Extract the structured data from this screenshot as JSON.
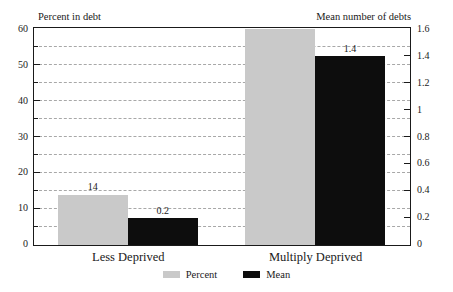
{
  "chart_data": {
    "type": "bar",
    "title": "",
    "xlabel": "",
    "ylabel": "Percent in debt",
    "y2label": "Mean number of debts",
    "categories": [
      "Less Deprived",
      "Multiply Deprived"
    ],
    "series": [
      {
        "name": "Percent",
        "axis": "left",
        "color": "#c9c9c9",
        "values": [
          14,
          60
        ],
        "labels": [
          "14",
          "60"
        ]
      },
      {
        "name": "Mean",
        "axis": "right",
        "color": "#0d0d0d",
        "values": [
          0.2,
          1.4
        ],
        "labels": [
          "0.2",
          "1.4"
        ]
      }
    ],
    "ylim": [
      0,
      60
    ],
    "y2lim": [
      0,
      1.6
    ],
    "yticks": [
      0,
      10,
      20,
      30,
      40,
      50,
      60
    ],
    "ytick_labels": [
      "0",
      "10",
      "20",
      "30",
      "40",
      "50",
      "60"
    ],
    "yminor_ticks": [
      5,
      15,
      25,
      35,
      45,
      55
    ],
    "y2ticks": [
      0,
      0.2,
      0.4,
      0.6,
      0.8,
      1,
      1.2,
      1.4,
      1.6
    ],
    "y2tick_labels": [
      "0",
      "0.2",
      "0.4",
      "0.6",
      "0.8",
      "1",
      "1.2",
      "1.4",
      "1.6"
    ],
    "grid": true,
    "grid_axis": "y",
    "grid_style": "dashed",
    "legend_position": "bottom-center",
    "legend": [
      "Percent",
      "Mean"
    ]
  },
  "axes": {
    "left_title": "Percent in debt",
    "right_title": "Mean number of debts"
  },
  "left_ticks": [
    {
      "label": "60",
      "value": 60
    },
    {
      "label": "50",
      "value": 50
    },
    {
      "label": "40",
      "value": 40
    },
    {
      "label": "30",
      "value": 30
    },
    {
      "label": "20",
      "value": 20
    },
    {
      "label": "10",
      "value": 10
    },
    {
      "label": "0",
      "value": 0
    }
  ],
  "right_ticks": [
    {
      "label": "1.6",
      "value": 1.6
    },
    {
      "label": "1.4",
      "value": 1.4
    },
    {
      "label": "1.2",
      "value": 1.2
    },
    {
      "label": "1",
      "value": 1.0
    },
    {
      "label": "0.8",
      "value": 0.8
    },
    {
      "label": "0.6",
      "value": 0.6
    },
    {
      "label": "0.4",
      "value": 0.4
    },
    {
      "label": "0.2",
      "value": 0.2
    },
    {
      "label": "0",
      "value": 0.0
    }
  ],
  "categories": [
    {
      "label": "Less Deprived"
    },
    {
      "label": "Multiply Deprived"
    }
  ],
  "bars": [
    {
      "group": 0,
      "series": "Percent",
      "label": "14"
    },
    {
      "group": 0,
      "series": "Mean",
      "label": "0.2"
    },
    {
      "group": 1,
      "series": "Percent",
      "label": "60"
    },
    {
      "group": 1,
      "series": "Mean",
      "label": "1.4"
    }
  ],
  "legend": [
    {
      "label": "Percent"
    },
    {
      "label": "Mean"
    }
  ],
  "colors": {
    "percent": "#c9c9c9",
    "mean": "#0d0d0d",
    "axis": "#1a1a1a",
    "grid": "#a8a8a8",
    "background": "#ffffff"
  }
}
